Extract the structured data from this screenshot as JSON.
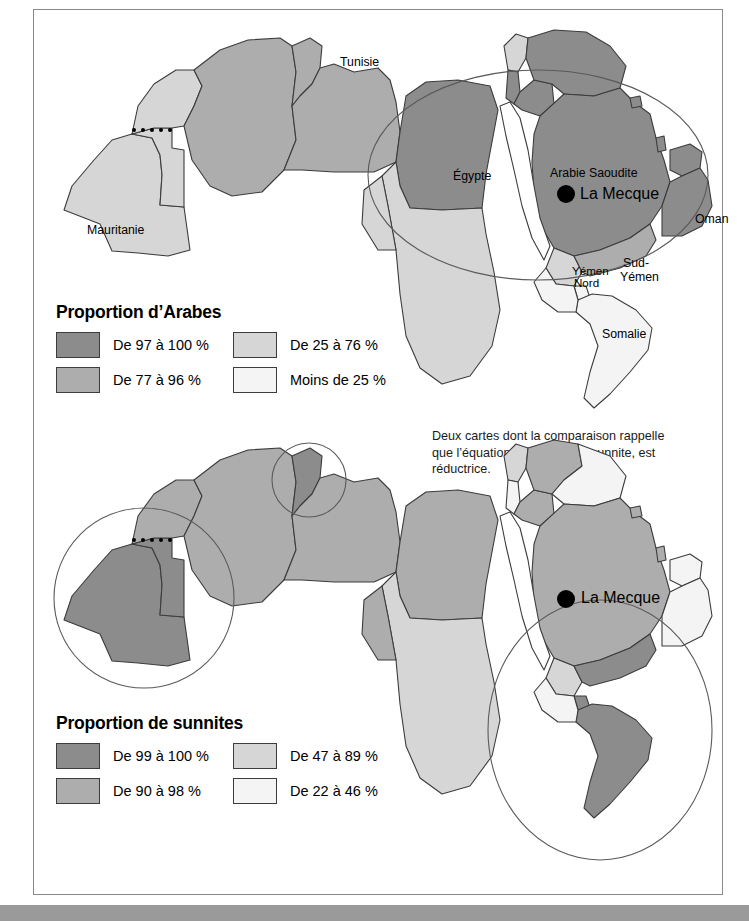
{
  "figure": {
    "caption": "Deux cartes dont la comparaison rappelle que l’équation : arabe égale sunnite, est réductrice."
  },
  "palette": {
    "darkest": "#8c8c8c",
    "dark": "#adadad",
    "light": "#d6d6d6",
    "lightest": "#f4f4f4",
    "outline": "#3c3c3c",
    "frame": "#8a8a8a",
    "bottom_bar": "#9a9a9a",
    "marker": "#000000"
  },
  "maps": [
    {
      "id": "arabes",
      "legend": {
        "title": "Proportion d’Arabes",
        "entries": [
          {
            "label": "De 97 à 100 %",
            "color": "#8c8c8c"
          },
          {
            "label": "De 25 à 76 %",
            "color": "#d6d6d6"
          },
          {
            "label": "De 77 à 96 %",
            "color": "#adadad"
          },
          {
            "label": "Moins de 25 %",
            "color": "#f4f4f4"
          }
        ]
      },
      "labels": [
        {
          "text": "Tunisie",
          "x": 306,
          "y": 46,
          "size": "normal"
        },
        {
          "text": "Mauritanie",
          "x": 53,
          "y": 214,
          "size": "normal"
        },
        {
          "text": "Égypte",
          "x": 419,
          "y": 160,
          "size": "normal"
        },
        {
          "text": "Arabie Saoudite",
          "x": 516,
          "y": 157,
          "size": "normal"
        },
        {
          "text": "La Mecque",
          "x": 546,
          "y": 181,
          "size": "big"
        },
        {
          "text": "Oman",
          "x": 661,
          "y": 203,
          "size": "normal"
        },
        {
          "text": "Yémen",
          "x": 538,
          "y": 257,
          "size": "sm"
        },
        {
          "text": "Nord",
          "x": 540,
          "y": 270,
          "size": "sm"
        },
        {
          "text": "Sud-",
          "x": 589,
          "y": 249,
          "size": "normal"
        },
        {
          "text": "Yémen",
          "x": 586,
          "y": 263,
          "size": "normal"
        },
        {
          "text": "Somalie",
          "x": 568,
          "y": 318,
          "size": "normal"
        }
      ],
      "marker": {
        "name": "La Mecque",
        "x": 532,
        "y": 184,
        "r": 9
      }
    },
    {
      "id": "sunnites",
      "legend": {
        "title": "Proportion de sunnites",
        "entries": [
          {
            "label": "De 99 à 100 %",
            "color": "#8c8c8c"
          },
          {
            "label": "De 47 à 89 %",
            "color": "#d6d6d6"
          },
          {
            "label": "De 90 à 98 %",
            "color": "#adadad"
          },
          {
            "label": "De 22 à 46 %",
            "color": "#f4f4f4"
          }
        ]
      },
      "labels": [
        {
          "text": "La Mecque",
          "x": 547,
          "y": 585,
          "size": "big"
        }
      ],
      "marker": {
        "name": "La Mecque",
        "x": 531,
        "y": 589,
        "r": 9
      }
    }
  ]
}
